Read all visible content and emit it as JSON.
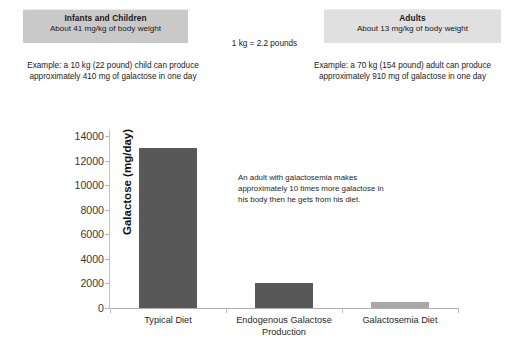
{
  "header": {
    "infants_box": {
      "title": "Infants and Children",
      "subtitle": "About 41 mg/kg of body weight",
      "bg_color": "#c9c9c9"
    },
    "adults_box": {
      "title": "Adults",
      "subtitle": "About 13 mg/kg of body weight",
      "bg_color": "#e0e0e0"
    },
    "conversion_note": "1 kg = 2.2 pounds",
    "example_infants": "Example: a 10 kg (22 pound) child can produce approximately 410 mg of galactose in one day",
    "example_adults": "Example: a 70 kg (154 pound) adult can produce approximately 910 mg of galactose in one day"
  },
  "chart_data": {
    "type": "bar",
    "title": "",
    "xlabel": "",
    "ylabel": "Galactose (mg/day)",
    "ylim": [
      0,
      14000
    ],
    "yticks": [
      0,
      2000,
      4000,
      6000,
      8000,
      10000,
      12000,
      14000
    ],
    "ytick_labels": [
      "0",
      "2000",
      "4000",
      "6000",
      "8000",
      "10000",
      "12000",
      "14000"
    ],
    "grid": false,
    "legend": "none",
    "categories": [
      "Typical Diet",
      "Endogenous Galactose Production",
      "Galactosemia Diet"
    ],
    "values": [
      13000,
      2000,
      500
    ],
    "bar_colors": [
      "#585858",
      "#585858",
      "#a8a8a8"
    ],
    "annotation": "An adult with galactosemia makes approximately 10 times more galactose in his body then he gets from his diet."
  }
}
